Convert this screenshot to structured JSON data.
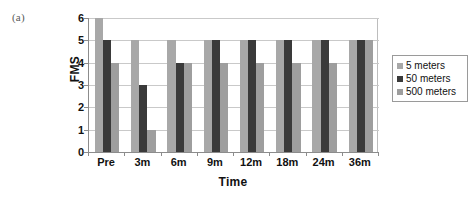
{
  "panel_label": "(a)",
  "legend": {
    "position": "right",
    "items": [
      {
        "label": "5 meters",
        "color": "#a8a8a8",
        "swatch_name": "legend-swatch-5-meters"
      },
      {
        "label": "50 meters",
        "color": "#3a3a3a",
        "swatch_name": "legend-swatch-50-meters"
      },
      {
        "label": "500 meters",
        "color": "#9e9e9e",
        "swatch_name": "legend-swatch-500-meters"
      }
    ]
  },
  "axes": {
    "y_title": "FMS",
    "x_title": "Time",
    "y_ticks": [
      "0",
      "1",
      "2",
      "3",
      "4",
      "5",
      "6"
    ],
    "x_ticks": [
      "Pre",
      "3m",
      "6m",
      "9m",
      "12m",
      "18m",
      "24m",
      "36m"
    ]
  },
  "chart_data": {
    "type": "bar",
    "title": "(a)",
    "xlabel": "Time",
    "ylabel": "FMS",
    "ylim": [
      0,
      6
    ],
    "ytick_step": 1,
    "grid": true,
    "legend_position": "right",
    "categories": [
      "Pre",
      "3m",
      "6m",
      "9m",
      "12m",
      "18m",
      "24m",
      "36m"
    ],
    "series": [
      {
        "name": "5 meters",
        "color": "#a8a8a8",
        "values": [
          6,
          5,
          5,
          5,
          5,
          5,
          5,
          5
        ]
      },
      {
        "name": "50 meters",
        "color": "#3a3a3a",
        "values": [
          5,
          3,
          4,
          5,
          5,
          5,
          5,
          5
        ]
      },
      {
        "name": "500 meters",
        "color": "#9e9e9e",
        "values": [
          4,
          1,
          4,
          4,
          4,
          4,
          4,
          5
        ]
      }
    ]
  }
}
